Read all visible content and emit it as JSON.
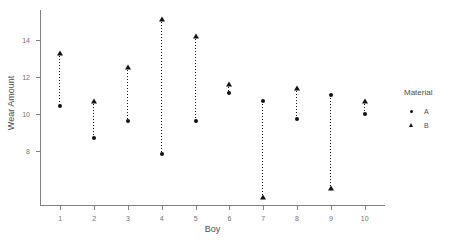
{
  "chart_data": {
    "type": "scatter",
    "title": "",
    "xlabel": "Boy",
    "ylabel": "Wear Amount",
    "x": [
      1,
      2,
      3,
      4,
      5,
      6,
      7,
      8,
      9,
      10
    ],
    "categories": [
      "1",
      "2",
      "3",
      "4",
      "5",
      "6",
      "7",
      "8",
      "9",
      "10"
    ],
    "series": [
      {
        "name": "A",
        "marker": "circle",
        "values": [
          10.4,
          8.7,
          9.6,
          7.8,
          9.6,
          11.1,
          10.7,
          9.7,
          11.0,
          10.0
        ]
      },
      {
        "name": "B",
        "marker": "triangle",
        "values": [
          13.3,
          10.7,
          12.5,
          15.1,
          14.2,
          11.6,
          5.5,
          11.4,
          6.0,
          10.7
        ]
      }
    ],
    "xlim": [
      0.4,
      10.6
    ],
    "ylim": [
      5.0,
      15.6
    ],
    "ytick_labels": [
      "8",
      "10",
      "12",
      "14"
    ],
    "ytick_values": [
      8,
      10,
      12,
      14
    ],
    "xtick_labels": [
      "1",
      "2",
      "3",
      "4",
      "5",
      "6",
      "7",
      "8",
      "9",
      "10"
    ],
    "grid": false,
    "legend_position": "right",
    "connector_style": "dotted-vertical",
    "marker_color": "#111111",
    "axis_color": "#808080"
  },
  "legend": {
    "title": "Material",
    "entries": [
      {
        "label": "A",
        "marker": "circle"
      },
      {
        "label": "B",
        "marker": "triangle"
      }
    ]
  }
}
